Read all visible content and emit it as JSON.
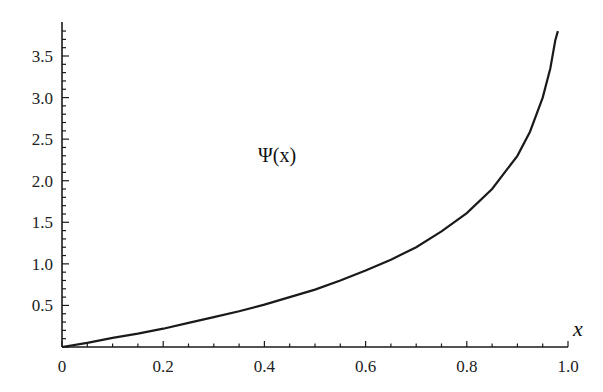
{
  "chart_data": {
    "type": "line",
    "title": "",
    "xlabel": "x",
    "ylabel": "",
    "xlim": [
      0,
      1.0
    ],
    "ylim": [
      0,
      3.85
    ],
    "grid": false,
    "x_ticks": [
      "0",
      "0.2",
      "0.4",
      "0.6",
      "0.8",
      "1.0"
    ],
    "y_ticks": [
      "0.5",
      "1.0",
      "1.5",
      "2.0",
      "2.5",
      "3.0",
      "3.5"
    ],
    "annotations": [
      {
        "text": "Ψ(x)",
        "x": 0.45,
        "y": 2.2
      }
    ],
    "series": [
      {
        "name": "Ψ(x)",
        "x": [
          0,
          0.05,
          0.1,
          0.15,
          0.2,
          0.25,
          0.3,
          0.35,
          0.4,
          0.45,
          0.5,
          0.55,
          0.6,
          0.65,
          0.7,
          0.75,
          0.8,
          0.85,
          0.9,
          0.925,
          0.95,
          0.965,
          0.975,
          0.98
        ],
        "values": [
          0,
          0.05,
          0.11,
          0.16,
          0.22,
          0.29,
          0.36,
          0.43,
          0.51,
          0.6,
          0.69,
          0.8,
          0.92,
          1.05,
          1.2,
          1.39,
          1.61,
          1.9,
          2.3,
          2.59,
          3.0,
          3.35,
          3.69,
          3.8
        ]
      }
    ]
  },
  "labels": {
    "curve": "Ψ(x)",
    "x_axis": "x"
  }
}
